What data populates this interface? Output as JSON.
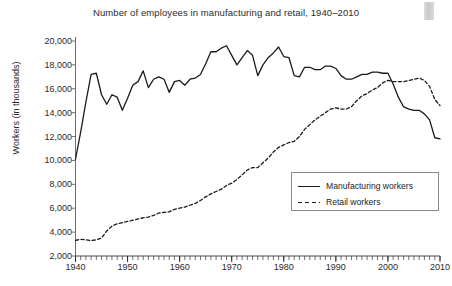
{
  "chart_data": {
    "type": "line",
    "title": "Number of employees in manufacturing and retail, 1940–2010",
    "xlabel": "",
    "ylabel": "Workers (in thousands)",
    "xlim": [
      1940,
      2010
    ],
    "ylim": [
      2000,
      20000
    ],
    "ytick_step": 2000,
    "xtick_step": 10,
    "minor_xticks": "annual",
    "grid": false,
    "legend_position": "lower-right",
    "ytick_labels": [
      "2,000",
      "4,000",
      "6,000",
      "8,000",
      "10,000",
      "12,000",
      "14,000",
      "16,000",
      "18,000",
      "20,000"
    ],
    "ytick_values": [
      2000,
      4000,
      6000,
      8000,
      10000,
      12000,
      14000,
      16000,
      18000,
      20000
    ],
    "xtick_labels": [
      "1940",
      "1950",
      "1960",
      "1970",
      "1980",
      "1990",
      "2000",
      "2010"
    ],
    "xtick_values": [
      1940,
      1950,
      1960,
      1970,
      1980,
      1990,
      2000,
      2010
    ],
    "x": [
      1940,
      1941,
      1942,
      1943,
      1944,
      1945,
      1946,
      1947,
      1948,
      1949,
      1950,
      1951,
      1952,
      1953,
      1954,
      1955,
      1956,
      1957,
      1958,
      1959,
      1960,
      1961,
      1962,
      1963,
      1964,
      1965,
      1966,
      1967,
      1968,
      1969,
      1970,
      1971,
      1972,
      1973,
      1974,
      1975,
      1976,
      1977,
      1978,
      1979,
      1980,
      1981,
      1982,
      1983,
      1984,
      1985,
      1986,
      1987,
      1988,
      1989,
      1990,
      1991,
      1992,
      1993,
      1994,
      1995,
      1996,
      1997,
      1998,
      1999,
      2000,
      2001,
      2002,
      2003,
      2004,
      2005,
      2006,
      2007,
      2008,
      2009,
      2010
    ],
    "series": [
      {
        "name": "Manufacturing workers",
        "style": "solid",
        "color": "#1a1a1a",
        "values": [
          10100,
          12400,
          14900,
          17200,
          17300,
          15500,
          14700,
          15500,
          15300,
          14200,
          15200,
          16300,
          16600,
          17500,
          16100,
          16800,
          17000,
          16800,
          15700,
          16600,
          16700,
          16300,
          16800,
          16900,
          17200,
          18100,
          19100,
          19100,
          19400,
          19600,
          18800,
          18000,
          18600,
          19200,
          18800,
          17100,
          18000,
          18600,
          19000,
          19500,
          18700,
          18600,
          17100,
          17000,
          17800,
          17800,
          17600,
          17600,
          17900,
          17900,
          17700,
          17100,
          16800,
          16800,
          17000,
          17200,
          17200,
          17400,
          17400,
          17300,
          17300,
          16400,
          15300,
          14500,
          14300,
          14200,
          14200,
          13900,
          13400,
          11900,
          11800
        ]
      },
      {
        "name": "Retail workers",
        "style": "dashed",
        "color": "#1a1a1a",
        "values": [
          3300,
          3400,
          3350,
          3300,
          3350,
          3500,
          4100,
          4500,
          4700,
          4800,
          4900,
          5000,
          5100,
          5200,
          5250,
          5400,
          5600,
          5650,
          5700,
          5900,
          6000,
          6100,
          6250,
          6400,
          6650,
          6950,
          7200,
          7400,
          7600,
          7900,
          8100,
          8400,
          8800,
          9200,
          9400,
          9400,
          9800,
          10200,
          10700,
          11100,
          11300,
          11500,
          11600,
          12000,
          12600,
          13000,
          13400,
          13700,
          14000,
          14300,
          14400,
          14300,
          14300,
          14500,
          15000,
          15400,
          15600,
          15900,
          16100,
          16500,
          16700,
          16600,
          16600,
          16600,
          16700,
          16800,
          16900,
          16700,
          16200,
          15100,
          14600
        ]
      }
    ]
  },
  "legend": {
    "items": [
      {
        "label": "Manufacturing workers",
        "style": "solid"
      },
      {
        "label": "Retail workers",
        "style": "dashed"
      }
    ]
  }
}
